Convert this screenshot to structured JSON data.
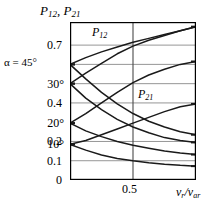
{
  "title": {
    "main": "P",
    "sub1": "12",
    "sep": ", ",
    "main2": "P",
    "sub2": "21"
  },
  "alpha": {
    "text": "α = 45°"
  },
  "axis": {
    "y_ticks": [
      "0.7",
      "0.4",
      "0.2",
      "0.1",
      "0"
    ],
    "angle_ticks": [
      "30°",
      "20°",
      "10°"
    ],
    "x_tick_mid": "0.5",
    "x_label_main": "v",
    "x_label_sub1": "r",
    "x_label_slash": "/v",
    "x_label_sub2": "ar"
  },
  "annotations": {
    "p12": {
      "main": "P",
      "sub": "12"
    },
    "p21": {
      "main": "P",
      "sub": "21"
    }
  },
  "colors": {
    "frame": "#000000",
    "grid": "#8a8a8a",
    "curve": "#1a1a1a",
    "background": "#ffffff"
  },
  "chart_data": {
    "type": "line",
    "title": "P12, P21",
    "xlabel": "v_r / v_ar",
    "ylabel": "P12, P21",
    "xlim": [
      0,
      1
    ],
    "ylim": [
      0,
      0.82
    ],
    "grid": true,
    "legend": "inline-annotations",
    "x_ticks": [
      0.5
    ],
    "y_ticks": [
      0,
      0.1,
      0.2,
      0.4,
      0.7
    ],
    "angle_markers": [
      {
        "label": "α = 45°",
        "y": 0.6
      },
      {
        "label": "30°",
        "y": 0.5
      },
      {
        "label": "20°",
        "y": 0.295
      },
      {
        "label": "10°",
        "y": 0.185
      }
    ],
    "series": [
      {
        "name": "P12 alpha=45",
        "family": "P12",
        "alpha_deg": 45,
        "x": [
          0.0,
          0.125,
          0.25,
          0.375,
          0.5,
          0.625,
          0.75,
          0.875,
          1.0
        ],
        "y": [
          0.6,
          0.635,
          0.665,
          0.69,
          0.715,
          0.735,
          0.755,
          0.775,
          0.795
        ]
      },
      {
        "name": "P12 alpha=30",
        "family": "P12",
        "alpha_deg": 30,
        "x": [
          0.0,
          0.125,
          0.25,
          0.375,
          0.5,
          0.625,
          0.75,
          0.875,
          1.0
        ],
        "y": [
          0.5,
          0.555,
          0.605,
          0.655,
          0.695,
          0.725,
          0.75,
          0.775,
          0.795
        ]
      },
      {
        "name": "P12 alpha=20",
        "family": "P12",
        "alpha_deg": 20,
        "x": [
          0.0,
          0.125,
          0.25,
          0.375,
          0.5,
          0.625,
          0.75,
          0.875,
          1.0
        ],
        "y": [
          0.295,
          0.345,
          0.4,
          0.455,
          0.505,
          0.545,
          0.575,
          0.6,
          0.615
        ]
      },
      {
        "name": "P12 alpha=10",
        "family": "P12",
        "alpha_deg": 10,
        "x": [
          0.0,
          0.125,
          0.25,
          0.375,
          0.5,
          0.625,
          0.75,
          0.875,
          1.0
        ],
        "y": [
          0.185,
          0.205,
          0.235,
          0.265,
          0.295,
          0.325,
          0.355,
          0.38,
          0.395
        ]
      },
      {
        "name": "P21 alpha=45",
        "family": "P21",
        "alpha_deg": 45,
        "x": [
          0.0,
          0.125,
          0.25,
          0.375,
          0.5,
          0.625,
          0.75,
          0.875,
          1.0
        ],
        "y": [
          0.6,
          0.525,
          0.455,
          0.395,
          0.345,
          0.305,
          0.275,
          0.25,
          0.235
        ]
      },
      {
        "name": "P21 alpha=30",
        "family": "P21",
        "alpha_deg": 30,
        "x": [
          0.0,
          0.125,
          0.25,
          0.375,
          0.5,
          0.625,
          0.75,
          0.875,
          1.0
        ],
        "y": [
          0.5,
          0.425,
          0.365,
          0.315,
          0.275,
          0.245,
          0.22,
          0.205,
          0.195
        ]
      },
      {
        "name": "P21 alpha=20",
        "family": "P21",
        "alpha_deg": 20,
        "x": [
          0.0,
          0.125,
          0.25,
          0.375,
          0.5,
          0.625,
          0.75,
          0.875,
          1.0
        ],
        "y": [
          0.295,
          0.255,
          0.225,
          0.2,
          0.18,
          0.165,
          0.15,
          0.14,
          0.132
        ]
      },
      {
        "name": "P21 alpha=10",
        "family": "P21",
        "alpha_deg": 10,
        "x": [
          0.0,
          0.125,
          0.25,
          0.375,
          0.5,
          0.625,
          0.75,
          0.875,
          1.0
        ],
        "y": [
          0.185,
          0.155,
          0.13,
          0.112,
          0.1,
          0.09,
          0.082,
          0.076,
          0.072
        ]
      }
    ]
  }
}
